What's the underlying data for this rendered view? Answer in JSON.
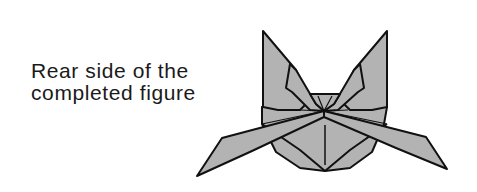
{
  "caption": {
    "line1": "Rear side of the",
    "line2": "completed figure"
  },
  "figure": {
    "fill_color": "#b3b3b3",
    "stroke_color": "#111111"
  }
}
